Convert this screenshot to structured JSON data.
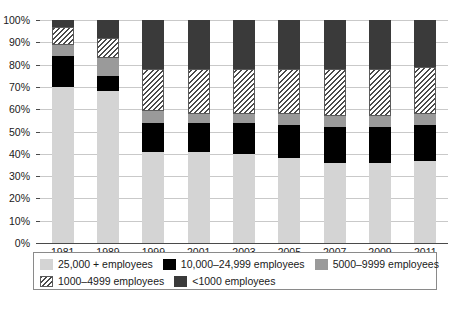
{
  "chart_data": {
    "type": "bar",
    "stacked": true,
    "normalized": "100%",
    "title": "",
    "xlabel": "",
    "ylabel": "",
    "ylim": [
      0,
      100
    ],
    "yticks": [
      "0%",
      "10%",
      "20%",
      "30%",
      "40%",
      "50%",
      "60%",
      "70%",
      "80%",
      "90%",
      "100%"
    ],
    "ytick_values": [
      0,
      10,
      20,
      30,
      40,
      50,
      60,
      70,
      80,
      90,
      100
    ],
    "grid": "horizontal",
    "legend_position": "bottom",
    "categories": [
      "1981",
      "1989",
      "1999",
      "2001",
      "2003",
      "2005",
      "2007",
      "2009",
      "2011"
    ],
    "series": [
      {
        "name": "25,000 + employees",
        "color": "#d4d4d4",
        "pattern": "solid",
        "values": [
          70,
          68,
          41,
          41,
          40,
          38,
          36,
          36,
          37
        ]
      },
      {
        "name": "10,000–24,999 employees",
        "color": "#000000",
        "pattern": "solid",
        "values": [
          14,
          7,
          13,
          13,
          14,
          15,
          16,
          16,
          16
        ]
      },
      {
        "name": "5000–9999 employees",
        "color": "#9a9a9a",
        "pattern": "solid",
        "values": [
          5,
          8,
          5,
          4,
          4,
          5,
          5,
          5,
          5
        ]
      },
      {
        "name": "1000–4999 employees",
        "color": "#ffffff",
        "pattern": "diagonal-hatch",
        "values": [
          8,
          9,
          19,
          20,
          20,
          20,
          21,
          21,
          21
        ]
      },
      {
        "name": "<1000 employees",
        "color": "#3a3a3a",
        "pattern": "solid",
        "values": [
          3,
          8,
          22,
          22,
          22,
          22,
          22,
          22,
          21
        ]
      }
    ]
  },
  "legend": {
    "rows": [
      [
        {
          "label": "25,000 + employees",
          "swatch": "s0"
        },
        {
          "label": "10,000–24,999 employees",
          "swatch": "s1"
        },
        {
          "label": "5000–9999 employees",
          "swatch": "s2"
        }
      ],
      [
        {
          "label": "1000–4999 employees",
          "swatch": "s3"
        },
        {
          "label": "<1000 employees",
          "swatch": "s4"
        }
      ]
    ]
  },
  "caption": {
    "text": ""
  }
}
